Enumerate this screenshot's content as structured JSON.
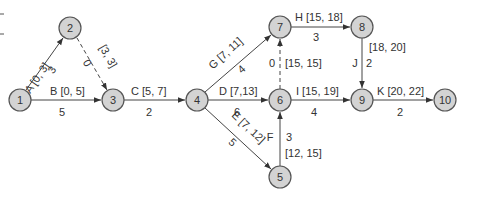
{
  "diagram": {
    "type": "activity-on-arrow network",
    "nodes": [
      {
        "id": "1",
        "label": "1",
        "x": 20,
        "y": 100
      },
      {
        "id": "2",
        "label": "2",
        "x": 70,
        "y": 28
      },
      {
        "id": "3",
        "label": "3",
        "x": 113,
        "y": 100
      },
      {
        "id": "4",
        "label": "4",
        "x": 197,
        "y": 100
      },
      {
        "id": "5",
        "label": "5",
        "x": 280,
        "y": 177
      },
      {
        "id": "6",
        "label": "6",
        "x": 280,
        "y": 100
      },
      {
        "id": "7",
        "label": "7",
        "x": 280,
        "y": 27
      },
      {
        "id": "8",
        "label": "8",
        "x": 362,
        "y": 27
      },
      {
        "id": "9",
        "label": "9",
        "x": 362,
        "y": 100
      },
      {
        "id": "10",
        "label": "10",
        "x": 445,
        "y": 100
      }
    ],
    "activities": [
      {
        "name": "A",
        "from": "1",
        "to": "2",
        "duration": "3",
        "es_ef": "[0, 3]",
        "label": "A [0, 3]",
        "dummy": false
      },
      {
        "name": "B",
        "from": "1",
        "to": "3",
        "duration": "5",
        "es_ef": "[0, 5]",
        "label": "B [0, 5]",
        "dummy": false
      },
      {
        "name": "dummy-2-3",
        "from": "2",
        "to": "3",
        "duration": "0",
        "es_ef": "[3, 3]",
        "label": "[3, 3]",
        "dummy": true
      },
      {
        "name": "C",
        "from": "3",
        "to": "4",
        "duration": "2",
        "es_ef": "[5, 7]",
        "label": "C [5, 7]",
        "dummy": false
      },
      {
        "name": "G",
        "from": "4",
        "to": "7",
        "duration": "4",
        "es_ef": "[7, 11]",
        "label": "G [7, 11]",
        "dummy": false
      },
      {
        "name": "D",
        "from": "4",
        "to": "6",
        "duration": "6",
        "es_ef": "[7,13]",
        "label": "D [7,13]",
        "dummy": false
      },
      {
        "name": "E",
        "from": "4",
        "to": "5",
        "duration": "5",
        "es_ef": "[7, 12]",
        "label": "E [7, 12]",
        "dummy": false
      },
      {
        "name": "F",
        "from": "5",
        "to": "6",
        "duration": "3",
        "es_ef": "[12, 15]",
        "label": "F",
        "dummy": false
      },
      {
        "name": "dummy-6-7",
        "from": "6",
        "to": "7",
        "duration": "0",
        "es_ef": "[15, 15]",
        "label": "[15, 15]",
        "dummy": true
      },
      {
        "name": "H",
        "from": "7",
        "to": "8",
        "duration": "3",
        "es_ef": "[15, 18]",
        "label": "H [15, 18]",
        "dummy": false
      },
      {
        "name": "I",
        "from": "6",
        "to": "9",
        "duration": "4",
        "es_ef": "[15, 19]",
        "label": "I [15, 19]",
        "dummy": false
      },
      {
        "name": "J",
        "from": "8",
        "to": "9",
        "duration": "2",
        "es_ef": "[18, 20]",
        "label": "J",
        "dummy": false
      },
      {
        "name": "K",
        "from": "9",
        "to": "10",
        "duration": "2",
        "es_ef": "[20, 22]",
        "label": "K [20, 22]",
        "dummy": false
      }
    ],
    "colors": {
      "node_fill": "#d3d3d3",
      "node_stroke": "#555555",
      "edge": "#444444",
      "text": "#333333"
    }
  }
}
